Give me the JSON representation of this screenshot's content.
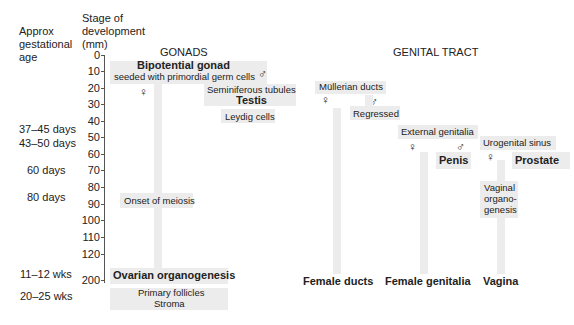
{
  "headers": {
    "age": [
      "Approx",
      "gestational",
      "age"
    ],
    "stage": [
      "Stage of",
      "development",
      "(mm)"
    ]
  },
  "ages": [
    {
      "label": "37–45 days",
      "y": 30
    },
    {
      "label": "43–50 days",
      "y": 47
    },
    {
      "label": "60 days",
      "y": 81
    },
    {
      "label": "80 days",
      "y": 191
    },
    {
      "label": "11–12 wks",
      "y": 267
    },
    {
      "label": "20–25 wks",
      "y": 290
    }
  ],
  "ticks": [
    {
      "label": "0",
      "y": 10
    },
    {
      "label": "10",
      "y": 27
    },
    {
      "label": "20",
      "y": 44
    },
    {
      "label": "30",
      "y": 61
    },
    {
      "label": "40",
      "y": 78
    },
    {
      "label": "50",
      "y": 95
    },
    {
      "label": "60",
      "y": 112
    },
    {
      "label": "70",
      "y": 129
    },
    {
      "label": "80",
      "y": 146
    },
    {
      "label": "90",
      "y": 163
    },
    {
      "label": "100",
      "y": 180
    },
    {
      "label": "110",
      "y": 197
    },
    {
      "label": "120",
      "y": 214
    },
    {
      "label": "200",
      "y": 247
    }
  ],
  "gonads": {
    "title": "GONADS",
    "bipotential": "Bipotential gonad",
    "seeded": "seeded with primordial germ cells",
    "female_symbol": "♀",
    "male_symbol": "♂",
    "seminiferous": "Seminiferous tubules",
    "testis": "Testis",
    "leydig": "Leydig cells",
    "meiosis": "Onset of meiosis",
    "ovarian": "Ovarian organogenesis",
    "follicles": "Primary follicles",
    "stroma": "Stroma"
  },
  "tract": {
    "title": "GENITAL TRACT",
    "mullerian": "Müllerian ducts",
    "regressed": "Regressed",
    "external": "External genitalia",
    "penis": "Penis",
    "urogenital": "Urogenital sinus",
    "prostate": "Prostate",
    "vaginal_org": [
      "Vaginal",
      "organo-",
      "genesis"
    ],
    "female_ducts": "Female ducts",
    "female_genitalia": "Female genitalia",
    "vagina": "Vagina",
    "female_symbol": "♀",
    "male_symbol": "♂"
  }
}
